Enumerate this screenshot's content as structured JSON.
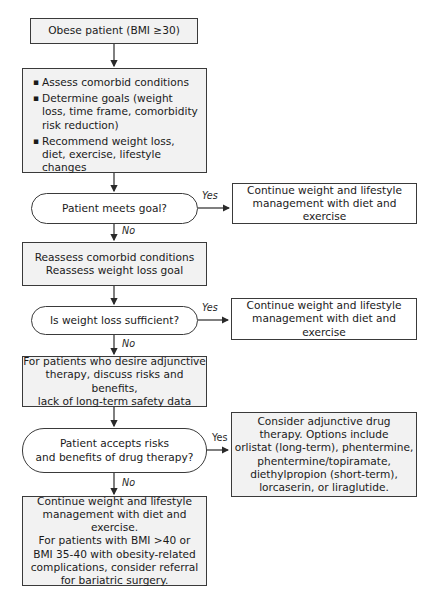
{
  "nodes": {
    "start": "Obese patient (BMI ≥30)",
    "assess": {
      "items": [
        "Assess comorbid conditions",
        "Determine goals (weight loss, time frame, comorbidity risk reduction)",
        "Recommend weight loss, diet, exercise, lifestyle changes"
      ]
    },
    "decision1": "Patient meets goal?",
    "continue1": "Continue weight and lifestyle\nmanagement with diet and exercise",
    "reassess": "Reassess comorbid conditions\nReassess weight loss goal",
    "decision2": "Is weight loss sufficient?",
    "continue2": "Continue weight and lifestyle\nmanagement with diet and exercise",
    "adjunctive": "For patients who desire adjunctive\ntherapy, discuss risks and benefits,\nlack of long-term safety data",
    "decision3": "Patient accepts risks\nand benefits of drug therapy?",
    "drug_therapy": "Consider adjunctive drug\ntherapy. Options include\norlistat (long-term), phentermine,\nphentermine/topiramate,\ndiethylpropion (short-term),\nlorcaserin, or liraglutide.",
    "final": "Continue weight and lifestyle\nmanagement with diet and exercise.\nFor patients with BMI >40 or\nBMI 35-40 with obesity-related\ncomplications, consider referral\nfor bariatric surgery."
  },
  "labels": {
    "yes": "Yes",
    "no": "No"
  },
  "colors": {
    "box_fill": "#f2f2f2",
    "border": "#3a3a3a"
  }
}
